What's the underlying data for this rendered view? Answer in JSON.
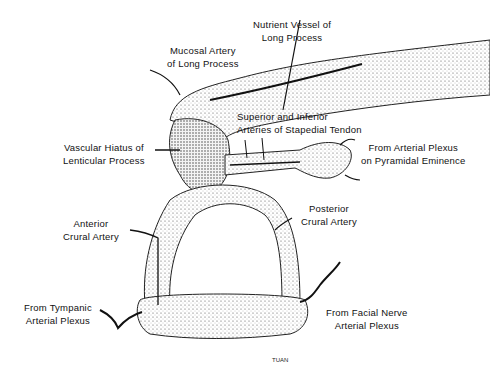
{
  "diagram": {
    "labels": {
      "nutrient_vessel": [
        "Nutrient Vessel of",
        "Long Process"
      ],
      "mucosal_artery": [
        "Mucosal Artery",
        "of Long Process"
      ],
      "stapedial_tendon": [
        "Superior and Inferior",
        "Arteries of Stapedial Tendon"
      ],
      "vascular_hiatus": [
        "Vascular Hiatus of",
        "Lenticular Process"
      ],
      "pyramidal_eminence": [
        "From Arterial Plexus",
        "on Pyramidal Eminence"
      ],
      "posterior_crural": [
        "Posterior",
        "Crural Artery"
      ],
      "anterior_crural": [
        "Anterior",
        "Crural Artery"
      ],
      "tympanic_plexus": [
        "From Tympanic",
        "Arterial Plexus"
      ],
      "facial_nerve_plexus": [
        "From Facial Nerve",
        "Arterial Plexus"
      ]
    },
    "signature": "TUAN"
  }
}
